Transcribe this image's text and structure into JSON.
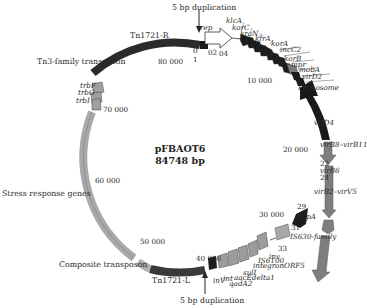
{
  "plasmid": {
    "name": "pFBAOT6",
    "size": "84748 bp"
  },
  "position_ticks": {
    "t0": "0",
    "t1": "1",
    "t02": "02",
    "t04": "04",
    "t10000": "10 000",
    "t20000": "20 000",
    "t22": "22",
    "t24": "24",
    "t29": "29",
    "t30000": "30 000",
    "t31": "31",
    "t33": "33",
    "t40000": "40 000",
    "t50000": "50 000",
    "t60000": "60 000",
    "t70000": "70 000",
    "t80000": "80 000"
  },
  "annotations": {
    "dup_top": "5 bp duplication",
    "dup_bottom": "5 bp duplication",
    "tn1721_r": "Tn1721-R",
    "tn1721_l": "Tn1721-L",
    "tn3_family": "Tn3-family transposon",
    "stress": "Stress response genes",
    "composite": "Composite transposon"
  },
  "genes": {
    "rep": "rep",
    "klcA": "klcA",
    "korC": "korC",
    "kraN": "kraN",
    "kfrA": "kfrA",
    "korA": "korA",
    "incC2": "incC2",
    "korB": "korB",
    "mpr": "mpr",
    "mobA": "mobA",
    "virD2": "virD2",
    "primosome": "Primosome",
    "virD4": "virD4",
    "virB8_B11": "virB8–virB11",
    "virB6": "virB6",
    "virB2_B5": "virB2–virV5",
    "topA": "topA",
    "is630": "IS630-family",
    "inv": "inv",
    "is6100": "IS6100",
    "integronORF5": "integronORF5",
    "sulI": "sulI",
    "aacEdelta": "aacEdelta1",
    "qadA2": "qadA2",
    "inV": "inV",
    "int": "int",
    "trbF": "trbF",
    "trbG": "trbG",
    "trbI": "trbI"
  },
  "colors": {
    "black_segment": "#1a1a1a",
    "dark_gray": "#3a3a3a",
    "mid_gray": "#8a8a8a",
    "light_gray": "#b5b5b5",
    "outline": "#444444"
  }
}
